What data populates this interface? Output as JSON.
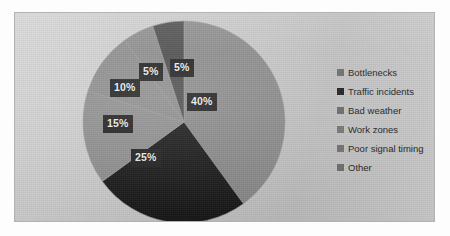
{
  "chart_data": {
    "type": "pie",
    "title": "",
    "subtitle": "",
    "xlabel": "",
    "ylabel": "",
    "grid": false,
    "legend_position": "right",
    "start_angle_deg": 0,
    "direction": "clockwise",
    "categories": [
      "Bottlenecks",
      "Traffic incidents",
      "Bad weather",
      "Work zones",
      "Poor signal timing",
      "Other"
    ],
    "values": [
      40,
      25,
      15,
      10,
      5,
      5
    ],
    "data_labels": [
      "40%",
      "25%",
      "15%",
      "10%",
      "5%",
      "5%"
    ],
    "slice_colors": [
      "#8a8a8a",
      "#171717",
      "#8f8f8f",
      "#8c8c8c",
      "#8b8b8b",
      "#4a4a4a"
    ],
    "legend_swatch_colors": [
      "#6e6e6e",
      "#1d1d1d",
      "#6b6b6b",
      "#777777",
      "#727272",
      "#6f6f6f"
    ],
    "slices": [
      {
        "label": "Bottlenecks",
        "value": 40,
        "data_label": "40%",
        "color": "#8a8a8a"
      },
      {
        "label": "Traffic incidents",
        "value": 25,
        "data_label": "25%",
        "color": "#171717"
      },
      {
        "label": "Bad weather",
        "value": 15,
        "data_label": "15%",
        "color": "#8f8f8f"
      },
      {
        "label": "Work zones",
        "value": 10,
        "data_label": "10%",
        "color": "#8c8c8c"
      },
      {
        "label": "Poor signal timing",
        "value": 5,
        "data_label": "5%",
        "color": "#8b8b8b"
      },
      {
        "label": "Other",
        "value": 5,
        "data_label": "5%",
        "color": "#4a4a4a"
      }
    ]
  },
  "chart": {
    "background_color": "#c9c9c9",
    "border_color": "#b3b3b3",
    "data_label_background": "#1c1c1c",
    "data_label_color": "#f2f2f2"
  },
  "labels": {
    "slice_0": "40%",
    "slice_1": "25%",
    "slice_2": "15%",
    "slice_3": "10%",
    "slice_4": "5%",
    "slice_5": "5%"
  },
  "legend": {
    "items": [
      {
        "label": "Bottlenecks"
      },
      {
        "label": "Traffic incidents"
      },
      {
        "label": "Bad weather"
      },
      {
        "label": "Work zones"
      },
      {
        "label": "Poor signal timing"
      },
      {
        "label": "Other"
      }
    ]
  }
}
